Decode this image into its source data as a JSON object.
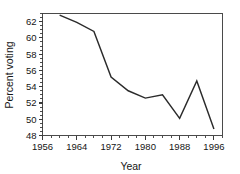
{
  "chart_data": {
    "type": "line",
    "title": "",
    "subtitle": "",
    "xlabel": "Year",
    "ylabel": "Percent voting",
    "x": [
      1960,
      1964,
      1968,
      1972,
      1976,
      1980,
      1984,
      1988,
      1992,
      1996
    ],
    "values": [
      62.8,
      61.9,
      60.8,
      55.2,
      53.5,
      52.6,
      53.0,
      50.1,
      54.7,
      48.8
    ],
    "series": [
      {
        "name": "Percent voting",
        "x": [
          1960,
          1964,
          1968,
          1972,
          1976,
          1980,
          1984,
          1988,
          1992,
          1996
        ],
        "values": [
          62.8,
          61.9,
          60.8,
          55.2,
          53.5,
          52.6,
          53.0,
          50.1,
          54.7,
          48.8
        ]
      }
    ],
    "xlim": [
      1956,
      1998
    ],
    "ylim": [
      48,
      63
    ],
    "xticks": [
      1956,
      1964,
      1972,
      1980,
      1988,
      1996
    ],
    "xtick_labels": [
      "1956",
      "1964",
      "1972",
      "1980",
      "1988",
      "1996"
    ],
    "yticks": [
      48,
      50,
      52,
      54,
      56,
      58,
      60,
      62
    ],
    "ytick_labels": [
      "48",
      "50",
      "52",
      "54",
      "56",
      "58",
      "60",
      "62"
    ],
    "x_minor_interval": 2,
    "y_minor_interval": 0.5,
    "grid": false,
    "legend": false,
    "legend_position": "none",
    "line_color": "#2b2b2b",
    "axis_color": "#3a3a3a",
    "background_color": "#ffffff",
    "markers": false,
    "annotations": []
  },
  "axis": {
    "x_title": "Year",
    "y_title": "Percent voting"
  }
}
